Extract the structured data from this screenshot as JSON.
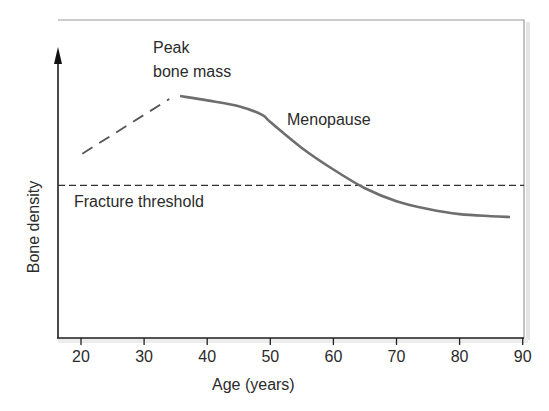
{
  "chart_data": {
    "type": "line",
    "title": "",
    "xlabel": "Age (years)",
    "ylabel": "Bone density",
    "xlim": [
      17,
      90
    ],
    "ylim": [
      0,
      100
    ],
    "x_ticks": [
      20,
      30,
      40,
      50,
      60,
      70,
      80,
      90
    ],
    "y_ticks": [],
    "grid": false,
    "legend": null,
    "series": [
      {
        "name": "Bone density (accrual phase)",
        "style": "dashed",
        "color": "#555555",
        "x": [
          20.2,
          34
        ],
        "values": [
          64,
          83
        ]
      },
      {
        "name": "Bone density (loss phase)",
        "style": "solid",
        "color": "#6e6e6e",
        "x": [
          35.7,
          40,
          45,
          48.7,
          50,
          55,
          60,
          65,
          70,
          75,
          80,
          85,
          88
        ],
        "values": [
          84,
          82.5,
          80.5,
          77.5,
          75,
          66,
          58.5,
          52,
          47.5,
          44.8,
          43,
          42.3,
          42
        ]
      },
      {
        "name": "Fracture threshold",
        "style": "dashed",
        "color": "#333333",
        "x": [
          17,
          90
        ],
        "values": [
          53,
          53
        ]
      }
    ],
    "annotations": [
      {
        "text": "Peak bone mass",
        "x": 35.7,
        "y": 84
      },
      {
        "text": "Menopause",
        "x": 49,
        "y": 77
      },
      {
        "text": "Fracture threshold",
        "x": 17,
        "y": 53
      }
    ]
  },
  "labels": {
    "peak_line1": "Peak",
    "peak_line2": "bone mass",
    "menopause": "Menopause",
    "fracture": "Fracture threshold",
    "xlabel": "Age (years)",
    "ylabel": "Bone density"
  },
  "ticks": [
    "20",
    "30",
    "40",
    "50",
    "60",
    "70",
    "80",
    "90"
  ]
}
